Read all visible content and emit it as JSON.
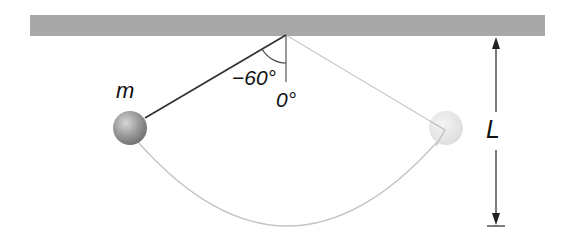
{
  "diagram": {
    "ceiling": {
      "color": "#a8a8a8"
    },
    "pivot": {
      "x": 286,
      "y": 35
    },
    "labels": {
      "mass": "m",
      "start_angle": "−60°",
      "equilibrium_angle": "0°",
      "length": "L"
    },
    "bob_start": {
      "label": "m",
      "angle_deg": -60,
      "color": "#8a8a8a"
    },
    "bob_end": {
      "angle_deg": 60,
      "color": "#e4e4e4"
    },
    "colors": {
      "string_active": "#333333",
      "string_ghost": "#c8c8c8",
      "arc": "#c4c4c4",
      "arrow": "#222222"
    }
  }
}
